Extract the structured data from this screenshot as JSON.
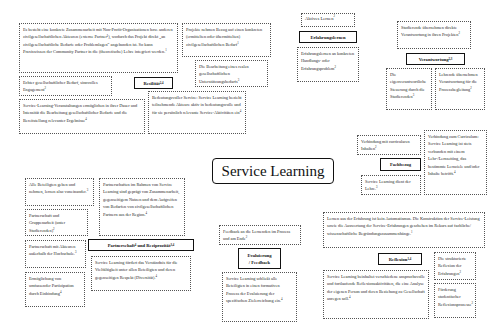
{
  "title": "Service Learning",
  "sections": {
    "resilitaet": {
      "label": "Resilität",
      "label_sup": "2,4",
      "items": [
        {
          "text": "Es besteht eine konkrete Zusammenarbeit mit Non-Profit-Organisationen bzw. anderen zivilgesellschaftlichen Akteuren (externe Partner¹), wodurch das Projekt direkt „an zivilgesellschaftliche Bedarfe oder Problemlagen“ angebunden ist. So kann Praxiswissen der Community Partner in die (theoretische) Lehre integriert werden.",
          "sup": "1"
        },
        {
          "text": "Projekte nehmen Bezug auf einen konkreten (ermittelten oder übermittelten) zivilgesellschaftlichen Bedarf",
          "sup": "1"
        },
        {
          "text": "Die Bearbeitung eines realen gesellschaftlichen Unterstützungsbedarfs",
          "sup": "3"
        },
        {
          "text": "Echter gesellschaftlicher Bedarf, sinnvolles Engagement",
          "sup": "2"
        },
        {
          "text": "Service-Learning-Veranstaltungen ermöglichen in ihrer Dauer und Intensität die Bearbeitung gesellschaftlicher Bedarfe und die Bereitstellung relevanter Ergebnisse",
          "sup": "4"
        },
        {
          "text": "Bedeutungsvoller Service: Service Learning bezieht teilnehmende Akteure aktiv in bedeutungsvolle und für sie persönlich relevante Service-Aktivitäten ein",
          "sup": "4"
        }
      ]
    },
    "erfahrungslernen": {
      "label": "Erfahrungslernen",
      "items": [
        {
          "text": "Aktives Lernen",
          "sup": "2"
        },
        {
          "text": "Erfahrungslernen an konkreten Handlungs- oder Erfahrungsproblem",
          "sup": "2"
        }
      ]
    },
    "verantwortung": {
      "label": "Verantwortung",
      "label_sup": "2,3",
      "items": [
        {
          "text": "Studierende übernehmen direkte Verantwortung in ihren Projekten",
          "sup": "2"
        },
        {
          "text": "Die eigenverantwortliche Steuerung durch die Studierenden",
          "sup": "3"
        },
        {
          "text": "Lehrende übernehmen Verantwortung für die Prozessbegleitung",
          "sup": "2"
        }
      ]
    },
    "fachbezug": {
      "label": "Fachbezug",
      "items": [
        {
          "text": "Verbindung mit curricularen Inhalten",
          "sup": "2"
        },
        {
          "text": "Service Learning dient der Lehre.",
          "sup": "3"
        },
        {
          "text": "Verbindung zum Curriculum: Service Learning ist stets verbunden mit einem Lehr-/Lernsetting, das bestimmte Lernziele und/oder Inhalte betrifft.",
          "sup": "4"
        }
      ]
    },
    "partnerschaft": {
      "label": "Partnerschaft",
      "label_sup_1": "4",
      "label_connector": "und Reziprozität",
      "label_sup": "3,4",
      "items": [
        {
          "text": "Alle Beteiligten geben und nehmen, lernen also voneinander.",
          "sup": "3"
        },
        {
          "text": "Partnerschaft und Gruppenarbeit (unter Studierenden)",
          "sup": "2"
        },
        {
          "text": "Partnerschaft mit Akteuren außerhalb der Hochschule.",
          "sup": "3"
        },
        {
          "text": "Ermöglichung von umfassender Partizipation durch Einbindung",
          "sup": "4"
        },
        {
          "text": "Partnerschaften im Rahmen von Service Learning sind geprägt von Zusammenarbeit, gegenseitigem Nutzen und dem Aufgreifen von Bedarfen von zivilgesellschaftlichen Partnern aus der Region.",
          "sup": "4"
        },
        {
          "text": "Service Learning fördert das Verständnis für die Vielfältigkeit unter allen Beteiligten und deren gegenseitigen Respekt (Diversität).",
          "sup": "4"
        }
      ]
    },
    "evaluierung": {
      "label_line1": "Evaluierung",
      "label_line2": "/ Feedback",
      "items": [
        {
          "text": "Feedback an die Lernenden im Prozess und am Ende",
          "sup": "2"
        },
        {
          "text": "Service Learning schließt alle Beteiligten in einen formativen Prozess der Evaluierung der spezifischen Zielerreichung ein.",
          "sup": "4"
        }
      ]
    },
    "reflexion": {
      "label": "Reflexion",
      "label_sup": "1,4",
      "items": [
        {
          "text": "Lernen aus der Erfahrung ist kein Automatismus. Die Konstruktion der Service-Leistung sowie die Auswertung der Service-Erfahrungen geschehen im Rekurs auf fachliche/ wissenschaftliche Begründungszusammenhänge.",
          "sup": "1"
        },
        {
          "text": "Die strukturierte Reflexion der Erfahrungen",
          "sup": "2"
        },
        {
          "text": "Service Learning beinhaltet verschiedene anspruchsvolle und fortlaufende Reflexionsaktivitäten, die eine Analyse der eigenen Person und deren Beziehung zu Gesellschaft anregen soll.",
          "sup": "4"
        },
        {
          "text": "Förderung studentischer Reflexionsprozesse",
          "sup": "2"
        }
      ]
    }
  }
}
